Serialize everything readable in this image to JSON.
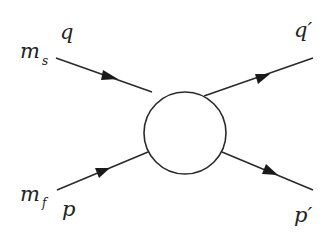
{
  "diagram": {
    "type": "scattering-vertex",
    "blob": {
      "cx": 185,
      "cy": 133,
      "r": 41
    },
    "lines": [
      {
        "name": "incoming-q",
        "x1": 56,
        "y1": 58,
        "x2": 146,
        "y2": 112,
        "arrow": [
          114,
          78
        ]
      },
      {
        "name": "incoming-p",
        "x1": 57,
        "y1": 190,
        "x2": 148,
        "y2": 152,
        "arrow": [
          104,
          170
        ]
      },
      {
        "name": "outgoing-q-prime",
        "x1": 204,
        "y1": 96,
        "x2": 313,
        "y2": 58,
        "arrow": [
          264,
          76
        ]
      },
      {
        "name": "outgoing-p-prime",
        "x1": 222,
        "y1": 152,
        "x2": 313,
        "y2": 190,
        "arrow": [
          273,
          172
        ]
      }
    ],
    "labels": {
      "m_s_main": "m",
      "m_s_sub": "s",
      "q": "q",
      "q_prime": "q′",
      "m_f_main": "m",
      "m_f_sub": "f",
      "p": "p",
      "p_prime": "p′"
    },
    "colors": {
      "stroke": "#2a2a2a",
      "background": "#ffffff"
    }
  }
}
